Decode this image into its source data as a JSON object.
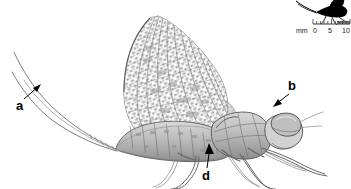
{
  "figure": {
    "kind": "scientific-illustration",
    "background_color": "#ffffff",
    "ink_color": "#4a4a4a",
    "label_color": "#000000",
    "width": 351,
    "height": 189
  },
  "labels": [
    {
      "id": "a",
      "text": "a",
      "x": 16,
      "y": 99,
      "points_to": "cerci-tail-filaments"
    },
    {
      "id": "b",
      "text": "b",
      "x": 288,
      "y": 79,
      "points_to": "compound-eye-head"
    },
    {
      "id": "d",
      "text": "d",
      "x": 202,
      "y": 169,
      "points_to": "abdomen-thorax-junction"
    }
  ],
  "scale_bar": {
    "unit_label": "mm",
    "ticks": [
      "0",
      "5",
      "10"
    ],
    "minor_tick_count": 10,
    "range_mm": 10
  },
  "inset": {
    "name": "silhouette-inset",
    "description": "solid black mayfly silhouette",
    "fill": "#000000"
  }
}
